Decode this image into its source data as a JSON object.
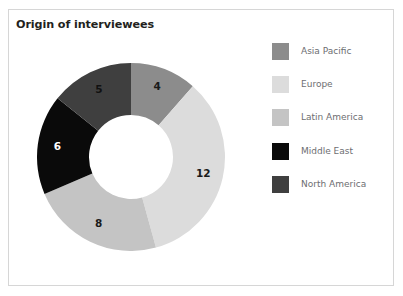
{
  "chart_data": {
    "type": "pie",
    "variant": "donut",
    "title": "Origin of interviewees",
    "xlabel": "",
    "ylabel": "",
    "total": 35,
    "legend_position": "right",
    "grid": false,
    "categories": [
      "Asia Pacific",
      "Europe",
      "Latin America",
      "Middle East",
      "North America"
    ],
    "values": [
      4,
      12,
      8,
      6,
      5
    ],
    "colors": [
      "#8c8c8c",
      "#dcdcdc",
      "#c4c4c4",
      "#0a0a0a",
      "#3f3f3f"
    ],
    "label_colors": [
      "#1a1a1a",
      "#1a1a1a",
      "#1a1a1a",
      "#ffffff",
      "#111111"
    ],
    "slices": [
      {
        "name": "Asia Pacific",
        "value": 4,
        "label": "4",
        "color": "#8c8c8c",
        "label_color": "#1a1a1a",
        "start_angle": 0.0,
        "end_angle": 41.1
      },
      {
        "name": "Europe",
        "value": 12,
        "label": "12",
        "color": "#dcdcdc",
        "label_color": "#1a1a1a",
        "start_angle": 41.1,
        "end_angle": 164.6
      },
      {
        "name": "Latin America",
        "value": 8,
        "label": "8",
        "color": "#c4c4c4",
        "label_color": "#1a1a1a",
        "start_angle": 164.6,
        "end_angle": 246.9
      },
      {
        "name": "Middle East",
        "value": 6,
        "label": "6",
        "color": "#0a0a0a",
        "label_color": "#ffffff",
        "start_angle": 246.9,
        "end_angle": 308.6
      },
      {
        "name": "North America",
        "value": 5,
        "label": "5",
        "color": "#3f3f3f",
        "label_color": "#111111",
        "start_angle": 308.6,
        "end_angle": 360.0
      }
    ]
  },
  "title": {
    "text": "Origin of interviewees"
  },
  "legend": {
    "items": [
      {
        "label": "Asia Pacific",
        "color": "#8c8c8c"
      },
      {
        "label": "Europe",
        "color": "#dcdcdc"
      },
      {
        "label": "Latin America",
        "color": "#c4c4c4"
      },
      {
        "label": "Middle East",
        "color": "#0a0a0a"
      },
      {
        "label": "North America",
        "color": "#3f3f3f"
      }
    ]
  },
  "style": {
    "frame_border_color": "#d6d6d6",
    "background": "#ffffff",
    "title_color": "#231f20",
    "legend_text_color": "#6d6e71"
  }
}
